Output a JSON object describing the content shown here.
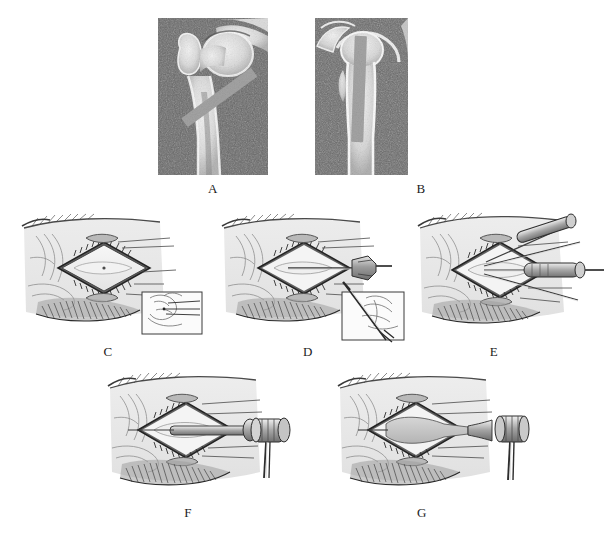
{
  "figure": {
    "background_color": "#ffffff",
    "panel_count": 7,
    "ink_color": "#2b2b2b",
    "tissue_color": "#dcdcdc",
    "metal_color": "#9b9b9b"
  },
  "panels": [
    {
      "id": "A",
      "label": "A",
      "kind": "radiograph",
      "caption_view": "anteroposterior hip radiograph with obliquely oriented implant across femoral neck",
      "x": 158,
      "y": 18,
      "w": 110,
      "h": 157,
      "label_x": 213,
      "label_y": 182,
      "implant": {
        "orientation": "oblique",
        "angle_deg": 36,
        "color": "#9a9a9a"
      }
    },
    {
      "id": "B",
      "label": "B",
      "kind": "radiograph",
      "caption_view": "lateral hip radiograph with vertically oriented implant down femoral neck",
      "x": 315,
      "y": 18,
      "w": 93,
      "h": 157,
      "label_x": 421,
      "label_y": 182,
      "implant": {
        "orientation": "vertical",
        "angle_deg": 2,
        "color": "#9a9a9a"
      }
    },
    {
      "id": "C",
      "label": "C",
      "kind": "operative-illustration",
      "caption_view": "lateral surgical exposure, diamond wound retracted, with inset orientation diagram",
      "x": 14,
      "y": 210,
      "w": 190,
      "h": 125,
      "label_x": 108,
      "label_y": 345,
      "has_inset": true,
      "instrument": "none"
    },
    {
      "id": "D",
      "label": "D",
      "kind": "operative-illustration",
      "caption_view": "guide pin introduced through exposure with inset showing pin trajectory",
      "x": 216,
      "y": 210,
      "w": 190,
      "h": 125,
      "label_x": 308,
      "label_y": 345,
      "has_inset": true,
      "instrument": "guide-pin-driver"
    },
    {
      "id": "E",
      "label": "E",
      "kind": "operative-illustration",
      "caption_view": "multiple guide wires and cannulated reamer in place",
      "x": 412,
      "y": 205,
      "w": 190,
      "h": 130,
      "label_x": 494,
      "label_y": 345,
      "has_inset": false,
      "instrument": "reamer-and-wires"
    },
    {
      "id": "F",
      "label": "F",
      "kind": "operative-illustration",
      "caption_view": "implant advanced over guide with T-handle impactor attached",
      "x": 100,
      "y": 368,
      "w": 195,
      "h": 130,
      "label_x": 188,
      "label_y": 506,
      "has_inset": false,
      "instrument": "t-handle-impactor"
    },
    {
      "id": "G",
      "label": "G",
      "kind": "operative-illustration",
      "caption_view": "final seating of implant using surgical mallet",
      "x": 330,
      "y": 368,
      "w": 195,
      "h": 130,
      "label_x": 422,
      "label_y": 506,
      "has_inset": false,
      "instrument": "surgical-mallet"
    }
  ]
}
